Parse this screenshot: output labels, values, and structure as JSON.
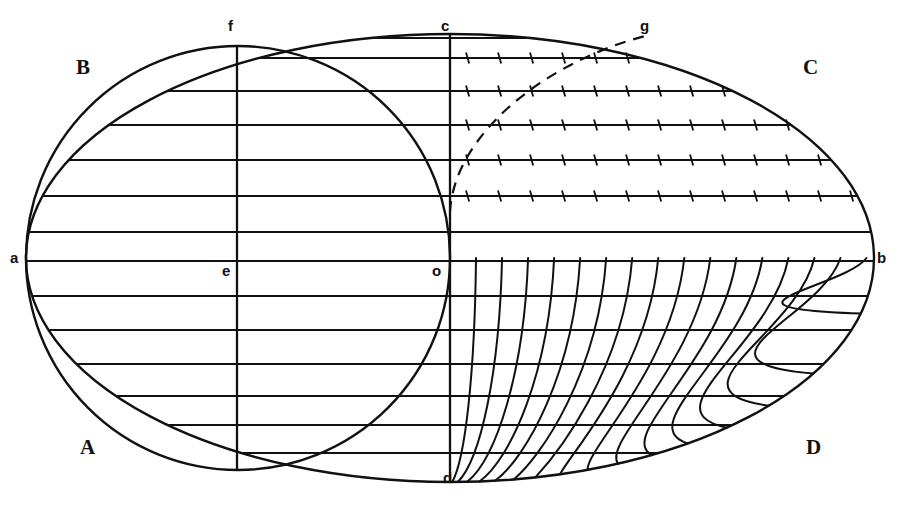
{
  "figure": {
    "ink_color": "#111111",
    "background_color": "#ffffff",
    "width": 899,
    "height": 505
  },
  "labels": {
    "corner_a_upper_left": "B",
    "corner_b_lower_left": "A",
    "corner_c_upper_right": "C",
    "corner_d_lower_right": "D",
    "point_left_axis": "a",
    "point_right_axis": "b",
    "point_top_center_left": "f",
    "point_center_left": "e",
    "point_top_center": "c",
    "point_origin": "o",
    "point_bottom_center": "d",
    "point_arc_top": "g"
  },
  "caption": {
    "text": ""
  },
  "geometry": {
    "frame": {
      "left_x": 27,
      "right_x": 873,
      "top_y": 35,
      "bottom_y": 468,
      "mid_y": 258,
      "center_x": 450
    },
    "circle": {
      "center_x": 238,
      "center_y": 258,
      "radius": 212,
      "description": "great circle of the hemisphere, left half of figure"
    },
    "ellipse_right": {
      "center_x": 450,
      "center_y": 258,
      "rx": 424,
      "ry": 224,
      "description": "outer oval boundary B-C / A-D"
    },
    "vertical_lines": [
      {
        "name": "f-e-d-left-meridian",
        "x": 237,
        "from_y": 38,
        "to_y": 465
      },
      {
        "name": "c-o-d-central-meridian",
        "x": 450,
        "from_y": 35,
        "to_y": 468
      }
    ],
    "parallels_y": [
      38,
      58,
      91,
      125,
      160,
      196,
      232,
      261,
      296,
      330,
      364,
      396,
      425,
      453
    ],
    "parallel_count": 14,
    "tick_rows_y": [
      58,
      91,
      125,
      160,
      196
    ],
    "tick_spacing_px": 32,
    "tick_length_px": 11,
    "meridian_curve_count": 16,
    "dashed_curve": {
      "from": "o",
      "to": "g",
      "start_x": 450,
      "start_y": 212,
      "end_x": 645,
      "end_y": 36,
      "style": "dashed"
    }
  }
}
